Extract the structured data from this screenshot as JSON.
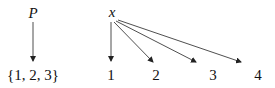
{
  "diagram": {
    "sources": [
      {
        "label": "P",
        "x": 33,
        "y": 6
      },
      {
        "label": "x",
        "x": 112,
        "y": 6
      }
    ],
    "targets": [
      {
        "label": "{1, 2, 3}",
        "x": 33,
        "y": 68
      },
      {
        "label": "1",
        "x": 111,
        "y": 68
      },
      {
        "label": "2",
        "x": 156,
        "y": 68
      },
      {
        "label": "3",
        "x": 213,
        "y": 68
      },
      {
        "label": "4",
        "x": 258,
        "y": 68
      }
    ],
    "arrows": [
      {
        "from": "P",
        "to": "{1, 2, 3}",
        "x1": 33,
        "y1": 22,
        "x2": 33,
        "y2": 61
      },
      {
        "from": "x",
        "to": "1",
        "x1": 111,
        "y1": 22,
        "x2": 111,
        "y2": 61
      },
      {
        "from": "x",
        "to": "2",
        "x1": 114,
        "y1": 22,
        "x2": 153,
        "y2": 62
      },
      {
        "from": "x",
        "to": "3",
        "x1": 116,
        "y1": 21,
        "x2": 196,
        "y2": 62
      },
      {
        "from": "x",
        "to": "4",
        "x1": 118,
        "y1": 20,
        "x2": 241,
        "y2": 62
      }
    ],
    "line_color": "#222222"
  }
}
